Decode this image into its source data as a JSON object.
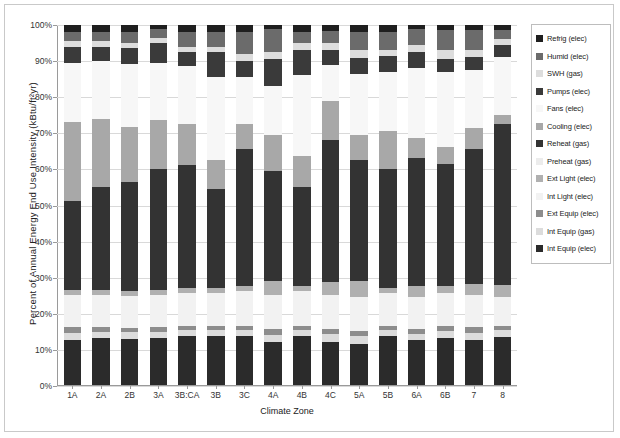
{
  "chart_data": {
    "type": "bar",
    "stacked": true,
    "title": "",
    "xlabel": "Climate Zone",
    "ylabel": "Percent of Annual Energy End Use Intensity (kBtu/ft²yr)",
    "ylim": [
      0,
      100
    ],
    "yticks": [
      "0%",
      "10%",
      "20%",
      "30%",
      "40%",
      "50%",
      "60%",
      "70%",
      "80%",
      "90%",
      "100%"
    ],
    "grid": true,
    "legend_position": "right",
    "categories": [
      "1A",
      "2A",
      "2B",
      "3A",
      "3B:CA",
      "3B",
      "3C",
      "4A",
      "4B",
      "4C",
      "5A",
      "5B",
      "6A",
      "6B",
      "7",
      "8"
    ],
    "series": [
      {
        "name": "Int Equip (elec)",
        "color": "#2b2b2b",
        "values": [
          12.5,
          13.0,
          13.0,
          13.0,
          13.5,
          13.5,
          13.5,
          12.0,
          13.5,
          12.0,
          11.5,
          13.5,
          12.5,
          13.0,
          12.5,
          13.5
        ]
      },
      {
        "name": "Int Equip (gas)",
        "color": "#dcdcdc",
        "values": [
          2.0,
          1.8,
          1.8,
          1.8,
          1.8,
          1.8,
          1.8,
          2.0,
          1.8,
          2.2,
          2.0,
          1.8,
          1.8,
          2.0,
          2.0,
          1.8
        ]
      },
      {
        "name": "Ext Equip (elec)",
        "color": "#8d8d8d",
        "values": [
          1.5,
          1.2,
          1.2,
          1.2,
          1.2,
          1.2,
          1.2,
          1.5,
          1.2,
          1.3,
          1.5,
          1.2,
          1.2,
          1.5,
          1.5,
          1.2
        ]
      },
      {
        "name": "Int Light (elec)",
        "color": "#f2f2f2",
        "values": [
          9.0,
          9.0,
          9.0,
          9.0,
          9.0,
          9.0,
          9.5,
          9.5,
          9.5,
          9.5,
          9.5,
          9.0,
          9.0,
          9.0,
          9.0,
          8.0
        ]
      },
      {
        "name": "Ext Light (elec)",
        "color": "#b0b0b0",
        "values": [
          1.5,
          1.5,
          1.5,
          1.5,
          1.5,
          1.5,
          1.5,
          4.0,
          1.5,
          3.5,
          4.5,
          1.5,
          3.0,
          2.0,
          3.0,
          3.5
        ]
      },
      {
        "name": "Preheat (gas)",
        "color": "#ececec",
        "values": [
          0.0,
          0.0,
          0.0,
          0.0,
          0.0,
          0.0,
          0.0,
          0.0,
          0.0,
          0.0,
          0.0,
          0.0,
          0.0,
          0.0,
          0.0,
          0.0
        ]
      },
      {
        "name": "Reheat (gas)",
        "color": "#333333",
        "values": [
          24.5,
          28.5,
          30.5,
          33.5,
          34.0,
          27.5,
          38.0,
          30.5,
          27.5,
          39.5,
          33.5,
          33.0,
          35.5,
          34.0,
          37.5,
          45.0
        ]
      },
      {
        "name": "Cooling (elec)",
        "color": "#a8a8a8",
        "values": [
          22.0,
          19.0,
          15.5,
          13.5,
          11.5,
          8.0,
          7.0,
          10.0,
          8.5,
          11.0,
          7.0,
          10.5,
          5.5,
          4.5,
          6.0,
          2.5
        ]
      },
      {
        "name": "Fans (elec)",
        "color": "#f7f7f7",
        "values": [
          16.5,
          16.0,
          17.5,
          16.0,
          16.0,
          23.0,
          13.0,
          13.5,
          22.5,
          10.0,
          17.0,
          16.5,
          19.5,
          21.0,
          16.0,
          16.0
        ]
      },
      {
        "name": "Pumps (elec)",
        "color": "#3a3a3a",
        "values": [
          4.5,
          4.0,
          4.5,
          5.5,
          4.0,
          7.0,
          4.5,
          7.5,
          7.0,
          4.0,
          4.5,
          4.5,
          4.5,
          3.5,
          3.5,
          3.5
        ]
      },
      {
        "name": "SWH (gas)",
        "color": "#dddddd",
        "values": [
          1.5,
          1.5,
          1.5,
          1.5,
          1.5,
          1.5,
          2.0,
          2.0,
          2.0,
          2.0,
          2.0,
          1.5,
          2.0,
          2.5,
          2.0,
          1.5
        ]
      },
      {
        "name": "Humid (elec)",
        "color": "#6b6b6b",
        "values": [
          2.5,
          2.5,
          3.0,
          2.5,
          4.0,
          4.0,
          6.0,
          6.5,
          3.0,
          3.5,
          5.0,
          5.0,
          4.5,
          5.5,
          5.5,
          2.5
        ]
      },
      {
        "name": "Refrig (elec)",
        "color": "#1f1f1f",
        "values": [
          2.0,
          2.0,
          2.0,
          1.0,
          2.0,
          2.0,
          2.0,
          1.0,
          2.0,
          1.5,
          2.0,
          2.0,
          1.0,
          1.5,
          1.5,
          1.5
        ]
      }
    ]
  },
  "legend": {
    "items": [
      {
        "label": "Refrig (elec)",
        "color": "#1f1f1f"
      },
      {
        "label": "Humid (elec)",
        "color": "#6b6b6b"
      },
      {
        "label": "SWH (gas)",
        "color": "#dddddd"
      },
      {
        "label": "Pumps (elec)",
        "color": "#3a3a3a"
      },
      {
        "label": "Fans (elec)",
        "color": "#f7f7f7"
      },
      {
        "label": "Cooling (elec)",
        "color": "#a8a8a8"
      },
      {
        "label": "Reheat (gas)",
        "color": "#333333"
      },
      {
        "label": "Preheat (gas)",
        "color": "#ececec"
      },
      {
        "label": "Ext Light (elec)",
        "color": "#b0b0b0"
      },
      {
        "label": "Int Light (elec)",
        "color": "#f2f2f2"
      },
      {
        "label": "Ext Equip (elec)",
        "color": "#8d8d8d"
      },
      {
        "label": "Int Equip (gas)",
        "color": "#dcdcdc"
      },
      {
        "label": "Int Equip (elec)",
        "color": "#2b2b2b"
      }
    ]
  }
}
